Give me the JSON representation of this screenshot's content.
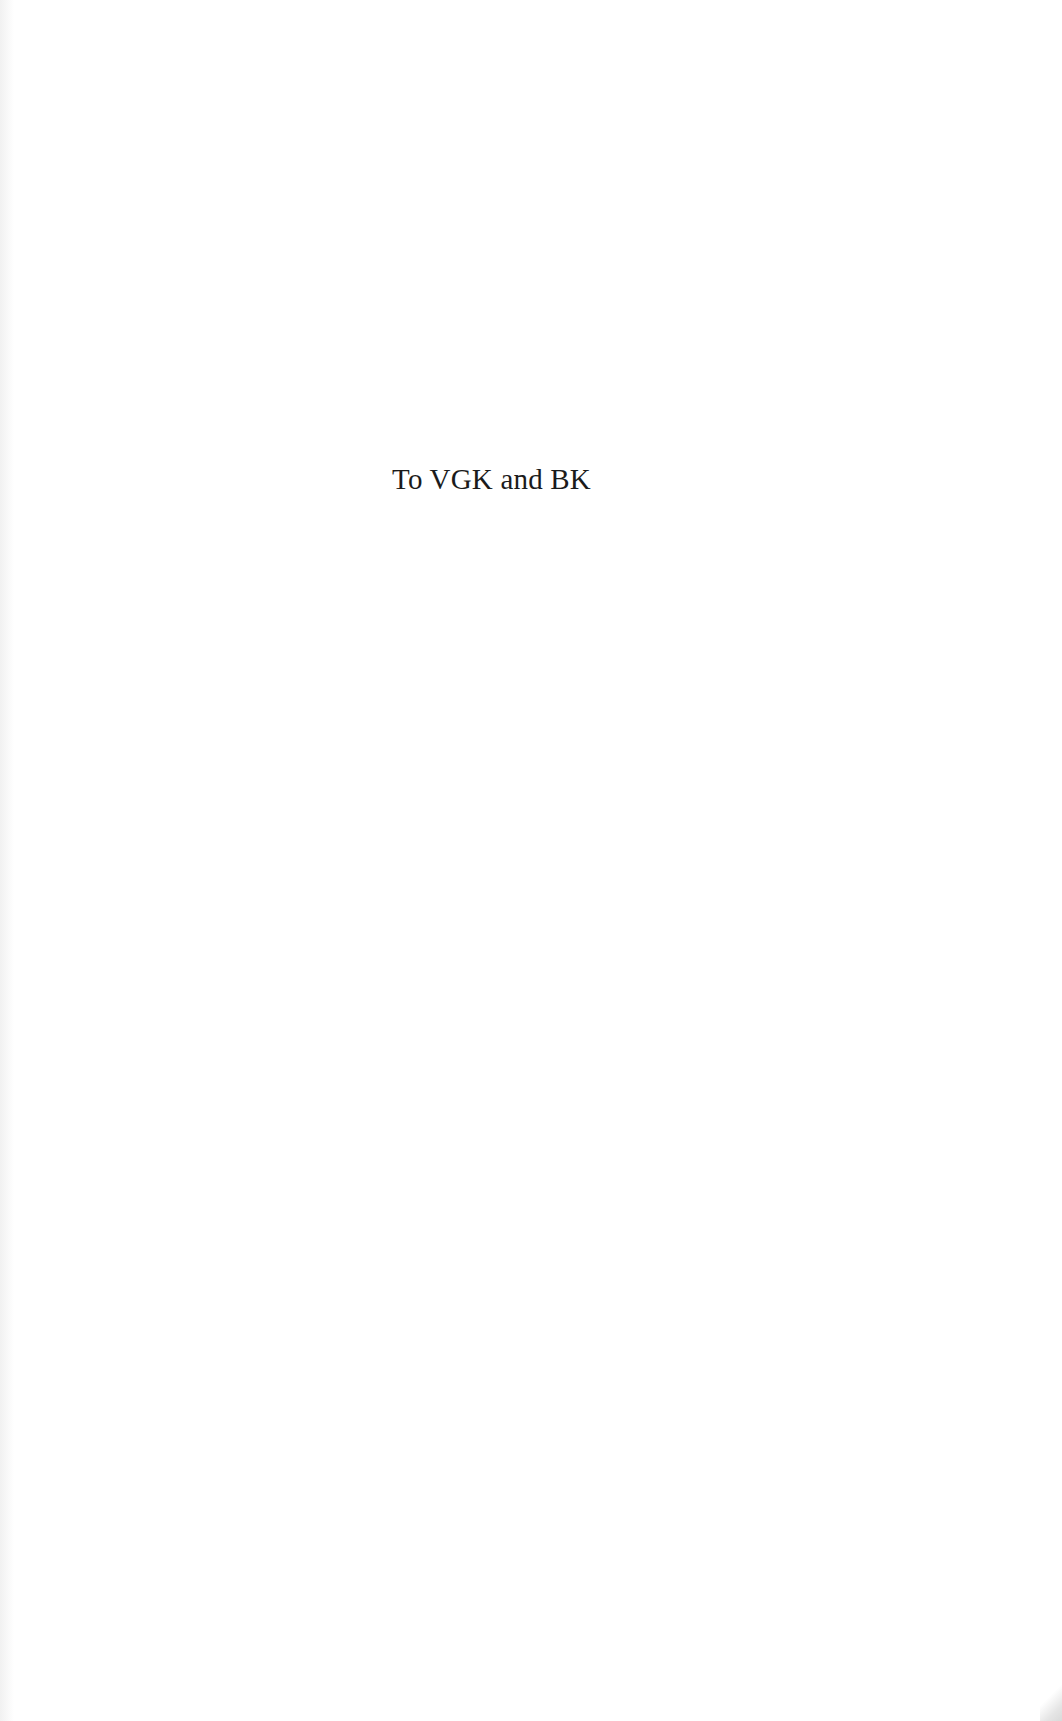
{
  "page": {
    "type": "dedication",
    "dedication_text": "To VGK and BK"
  },
  "colors": {
    "background": "#ffffff",
    "text": "#1b1b1b"
  }
}
